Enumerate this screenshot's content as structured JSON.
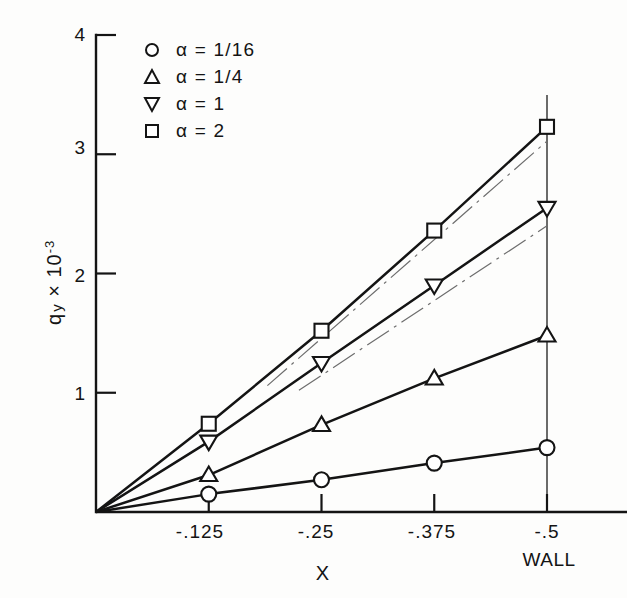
{
  "chart_data": {
    "type": "line",
    "title": "",
    "xlabel": "X",
    "ylabel": "q y x 10",
    "ylabel_exponent": "-3",
    "ylabel_sub": "y",
    "ylabel_base": "q",
    "xlim": [
      0,
      -0.5
    ],
    "ylim": [
      0,
      4
    ],
    "grid": false,
    "legend_position": "upper-left-inside",
    "x": [
      0,
      -0.125,
      -0.25,
      -0.375,
      -0.5
    ],
    "xticks": [
      "-.125",
      "-.25",
      "-.375",
      "-.5"
    ],
    "xtick_values": [
      -0.125,
      -0.25,
      -0.375,
      -0.5
    ],
    "yticks": [
      "1",
      "2",
      "3",
      "4"
    ],
    "ytick_values": [
      1,
      2,
      3,
      4
    ],
    "wall_annotation": "WALL",
    "wall_x": -0.5,
    "series": [
      {
        "name": "a = 1/16",
        "marker": "circle",
        "values": [
          0.0,
          0.15,
          0.27,
          0.41,
          0.54
        ]
      },
      {
        "name": "a = 1/4",
        "marker": "triangle-up",
        "values": [
          0.0,
          0.31,
          0.73,
          1.12,
          1.48
        ]
      },
      {
        "name": "a = 1",
        "marker": "triangle-down",
        "values": [
          0.0,
          0.59,
          1.25,
          1.9,
          2.55
        ]
      },
      {
        "name": "a = 2",
        "marker": "square",
        "values": [
          0.0,
          0.74,
          1.52,
          2.36,
          3.23
        ]
      }
    ],
    "reference_lines": [
      {
        "name": "asymptote-upper",
        "style": "dash-dot",
        "x": [
          -0.19,
          -0.5
        ],
        "values": [
          1.06,
          3.11
        ]
      },
      {
        "name": "asymptote-lower",
        "style": "dash-dot",
        "x": [
          -0.225,
          -0.5
        ],
        "values": [
          1.02,
          2.4
        ]
      }
    ]
  },
  "legend": {
    "items": [
      {
        "symbol": "circle",
        "label": "α = 1/16"
      },
      {
        "symbol": "triangle-up",
        "label": "α = 1/4"
      },
      {
        "symbol": "triangle-down",
        "label": "α = 1"
      },
      {
        "symbol": "square",
        "label": "α = 2"
      }
    ]
  },
  "axes": {
    "x_title": "X",
    "y_title_base": "q",
    "y_title_sub": "y",
    "y_title_mul": "× 10",
    "y_title_exp": "-3",
    "wall_label": "WALL"
  },
  "colors": {
    "ink": "#141414",
    "reference": "#6d6d6d",
    "background": "#fdfdfc",
    "marker_fill": "#ffffff"
  }
}
